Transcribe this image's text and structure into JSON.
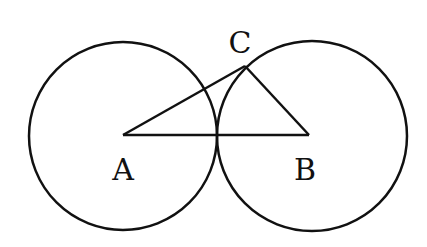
{
  "diagram": {
    "type": "geometry",
    "stroke_color": "#111111",
    "background": "#ffffff",
    "points": [
      {
        "id": "A",
        "label": "A",
        "x": 123,
        "y": 135,
        "label_x": 123,
        "label_y": 180
      },
      {
        "id": "B",
        "label": "B",
        "x": 309,
        "y": 135,
        "label_x": 305,
        "label_y": 180
      },
      {
        "id": "C",
        "label": "C",
        "x": 245,
        "y": 66,
        "label_x": 240,
        "label_y": 53
      }
    ],
    "circles": [
      {
        "id": "circle-left",
        "cx": 123,
        "cy": 136,
        "r": 94
      },
      {
        "id": "circle-right",
        "cx": 312,
        "cy": 136,
        "r": 95
      }
    ],
    "segments": [
      {
        "id": "AB",
        "from": "A",
        "to": "B"
      },
      {
        "id": "AC",
        "from": "A",
        "to": "C"
      },
      {
        "id": "BC",
        "from": "B",
        "to": "C"
      }
    ]
  }
}
